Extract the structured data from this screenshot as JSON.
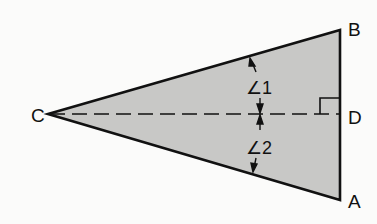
{
  "diagram": {
    "type": "triangle-with-altitude",
    "colors": {
      "fill": "#c8c8c6",
      "stroke": "#111111",
      "background": "#fbfbfa"
    },
    "vertices": {
      "C": {
        "label": "C",
        "x": 48,
        "y": 114
      },
      "B": {
        "label": "B",
        "x": 340,
        "y": 30
      },
      "A": {
        "label": "A",
        "x": 340,
        "y": 200
      },
      "D": {
        "label": "D",
        "x": 340,
        "y": 114
      }
    },
    "segments": [
      {
        "from": "C",
        "to": "B",
        "style": "solid"
      },
      {
        "from": "C",
        "to": "A",
        "style": "solid"
      },
      {
        "from": "B",
        "to": "A",
        "style": "solid"
      },
      {
        "from": "C",
        "to": "D",
        "style": "dashed"
      }
    ],
    "right_angle_at": "D",
    "angles": {
      "angle1": {
        "label": "∠1",
        "between": [
          "CB",
          "CD"
        ]
      },
      "angle2": {
        "label": "∠2",
        "between": [
          "CD",
          "CA"
        ]
      }
    }
  }
}
